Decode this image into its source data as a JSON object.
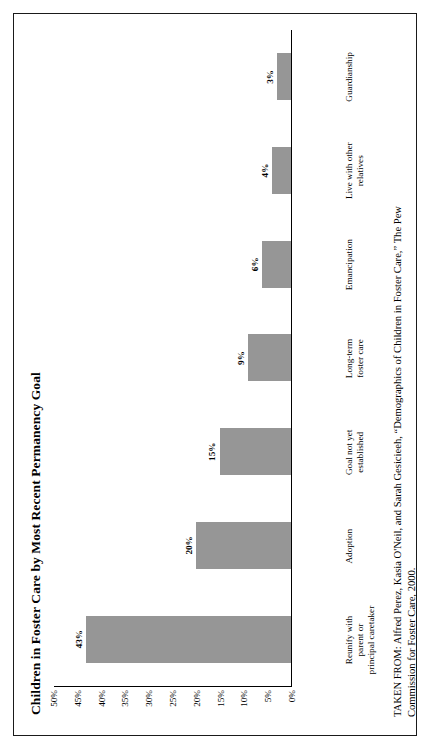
{
  "figure": {
    "title": "Children in Foster Care by Most Recent Permanency Goal",
    "source_note": "TAKEN FROM: Alfred Perez, Kasia O'Neil, and Sarah Gesicieeh, “Demographics of Children in Foster Care,” The Pew Commission for Foster Care, 2000."
  },
  "chart_data": {
    "type": "bar",
    "title": "Children in Foster Care by Most Recent Permanency Goal",
    "xlabel": "",
    "ylabel": "",
    "ylim": [
      0,
      50
    ],
    "grid": false,
    "legend": false,
    "bar_color": "#969696",
    "axis_color": "#000000",
    "y_ticks": [
      50,
      45,
      40,
      35,
      30,
      25,
      20,
      15,
      10,
      5,
      0
    ],
    "y_tick_labels": [
      "50%",
      "45%",
      "40%",
      "35%",
      "30%",
      "25%",
      "20%",
      "15%",
      "10%",
      "5%",
      "0%"
    ],
    "categories": [
      "Reunify with\nparent or\nprincipal caretaker",
      "Adoption",
      "Goal not yet\nestablished",
      "Long-term\nfoster care",
      "Emancipation",
      "Live with other\nrelatives",
      "Guardianship"
    ],
    "values": [
      43,
      20,
      15,
      9,
      6,
      4,
      3
    ],
    "data_labels": [
      "43%",
      "20%",
      "15%",
      "9%",
      "6%",
      "4%",
      "3%"
    ],
    "bars": [
      {
        "label_line1": "Reunify with",
        "label_line2": "parent or",
        "label_line3": "principal caretaker",
        "value": 43,
        "data_label": "43%"
      },
      {
        "label_line1": "Adoption",
        "label_line2": "",
        "label_line3": "",
        "value": 20,
        "data_label": "20%"
      },
      {
        "label_line1": "Goal not yet",
        "label_line2": "established",
        "label_line3": "",
        "value": 15,
        "data_label": "15%"
      },
      {
        "label_line1": "Long-term",
        "label_line2": "foster care",
        "label_line3": "",
        "value": 9,
        "data_label": "9%"
      },
      {
        "label_line1": "Emancipation",
        "label_line2": "",
        "label_line3": "",
        "value": 6,
        "data_label": "6%"
      },
      {
        "label_line1": "Live with other",
        "label_line2": "relatives",
        "label_line3": "",
        "value": 4,
        "data_label": "4%"
      },
      {
        "label_line1": "Guardianship",
        "label_line2": "",
        "label_line3": "",
        "value": 3,
        "data_label": "3%"
      }
    ]
  }
}
